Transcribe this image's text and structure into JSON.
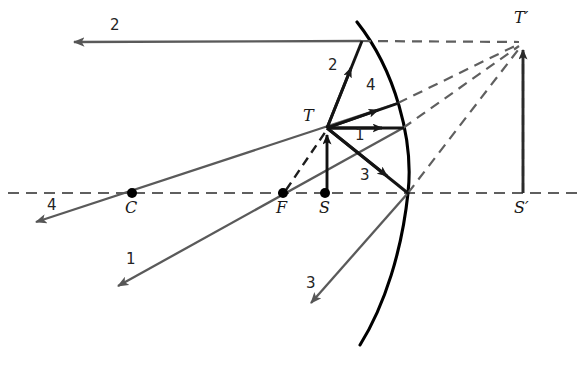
{
  "figure": {
    "kind": "ray-diagram",
    "background": "#ffffff"
  },
  "colors": {
    "axis": "#2b2b2b",
    "mirror": "#000000",
    "ray_incident": "#1a1a1a",
    "ray_reflected": "#5a5a5a",
    "virtual_dashed": "#5f5f5f",
    "object_arrow": "#111111",
    "image_arrow": "#2b2b2b",
    "point_dot": "#000000",
    "text": "#1a1a1a"
  },
  "points": [
    {
      "id": "C",
      "label": "C",
      "x": 132,
      "y": 193,
      "dot": true,
      "label_x": 125,
      "label_y": 200
    },
    {
      "id": "F",
      "label": "F",
      "x": 283,
      "y": 193,
      "dot": true,
      "label_x": 276,
      "label_y": 200
    },
    {
      "id": "S",
      "label": "S",
      "x": 325,
      "y": 193,
      "dot": true,
      "label_x": 319,
      "label_y": 200
    },
    {
      "id": "T",
      "label": "T",
      "x": 327,
      "y": 128,
      "dot": false,
      "label_x": 303,
      "label_y": 108
    },
    {
      "id": "Sp",
      "label": "S′",
      "x": 523,
      "y": 193,
      "dot": false,
      "label_x": 516,
      "label_y": 200
    },
    {
      "id": "Tp",
      "label": "T′",
      "x": 523,
      "y": 42,
      "dot": false,
      "label_x": 516,
      "label_y": 10
    }
  ],
  "ray_labels": [
    {
      "id": "ray2-reflected-label",
      "text": "2",
      "x": 110,
      "y": 18
    },
    {
      "id": "ray2-incident-label",
      "text": "2",
      "x": 328,
      "y": 58
    },
    {
      "id": "ray4-incident-label",
      "text": "4",
      "x": 366,
      "y": 78
    },
    {
      "id": "ray1-incident-label",
      "text": "1",
      "x": 355,
      "y": 128
    },
    {
      "id": "ray3-incident-label",
      "text": "3",
      "x": 360,
      "y": 168
    },
    {
      "id": "ray4-reflected-label",
      "text": "4",
      "x": 47,
      "y": 198
    },
    {
      "id": "ray1-reflected-label",
      "text": "1",
      "x": 126,
      "y": 252
    },
    {
      "id": "ray3-reflected-label",
      "text": "3",
      "x": 306,
      "y": 276
    }
  ],
  "axis": {
    "name": "optical-axis",
    "x1": 8,
    "y1": 193,
    "x2": 580,
    "y2": 193,
    "dash": "11 7"
  },
  "mirror": {
    "name": "concave-mirror-surface",
    "path": "M 357 22 C 395 70, 414 140, 408 193 C 402 250, 385 305, 360 345",
    "vertex_x": 408,
    "vertex_y": 193
  },
  "object_arrow": {
    "name": "object-arrow",
    "x1": 327,
    "y1": 193,
    "x2": 327,
    "y2": 131
  },
  "image_arrow": {
    "name": "image-arrow",
    "x1": 523,
    "y1": 193,
    "x2": 523,
    "y2": 46
  },
  "incident_rays": [
    {
      "id": "ray-1-incident",
      "label": "1",
      "x1": 327,
      "y1": 128,
      "x2": 403,
      "y2": 128,
      "arrow_t": 0.62
    },
    {
      "id": "ray-2-incident",
      "label": "2",
      "x1": 327,
      "y1": 128,
      "x2": 361,
      "y2": 41,
      "arrow_t": 0.66
    },
    {
      "id": "ray-3-incident",
      "label": "3",
      "x1": 327,
      "y1": 128,
      "x2": 408,
      "y2": 193,
      "arrow_t": 0.66
    },
    {
      "id": "ray-4-incident",
      "label": "4",
      "x1": 327,
      "y1": 128,
      "x2": 398,
      "y2": 103,
      "arrow_t": 0.62
    }
  ],
  "reflected_rays": [
    {
      "id": "ray-1-reflected",
      "label": "1",
      "x1": 403,
      "y1": 128,
      "x2": 112,
      "y2": 290,
      "arrow_t": 0.97
    },
    {
      "id": "ray-2-reflected",
      "label": "2",
      "x1": 361,
      "y1": 41,
      "x2": 70,
      "y2": 42,
      "arrow_t": 0.98
    },
    {
      "id": "ray-3-reflected",
      "label": "3",
      "x1": 408,
      "y1": 193,
      "x2": 306,
      "y2": 308,
      "arrow_t": 0.96
    },
    {
      "id": "ray-4-reflected",
      "label": "4",
      "x1": 398,
      "y1": 103,
      "x2": 30,
      "y2": 224,
      "arrow_t": 0.97
    }
  ],
  "virtual_extensions": [
    {
      "id": "virtual-from-ray2",
      "x1": 361,
      "y1": 41,
      "x2": 523,
      "y2": 42
    },
    {
      "id": "virtual-from-ray4",
      "x1": 398,
      "y1": 103,
      "x2": 523,
      "y2": 42
    },
    {
      "id": "virtual-from-ray1",
      "x1": 403,
      "y1": 128,
      "x2": 523,
      "y2": 42
    },
    {
      "id": "virtual-from-ray3",
      "x1": 408,
      "y1": 193,
      "x2": 523,
      "y2": 42
    },
    {
      "id": "virtual-F-to-T",
      "x1": 286,
      "y1": 190,
      "x2": 326,
      "y2": 131
    },
    {
      "id": "virtual-Sp-vertical",
      "x1": 523,
      "y1": 193,
      "x2": 523,
      "y2": 50
    }
  ]
}
